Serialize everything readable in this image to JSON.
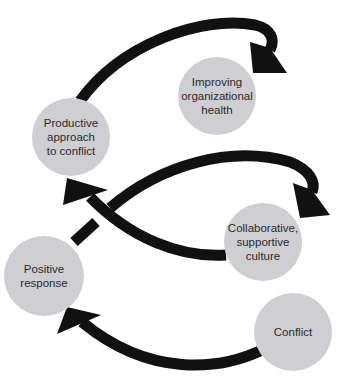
{
  "diagram": {
    "colors": {
      "node_fill": "#cfcfd3",
      "arrow": "#111111",
      "text": "#2a2a2a",
      "background": "#ffffff"
    },
    "nodes": [
      {
        "id": "improving",
        "label": "Improving\norganizational\nhealth",
        "cx": 217,
        "cy": 96,
        "r": 39
      },
      {
        "id": "productive",
        "label": "Productive\napproach\nto conflict",
        "cx": 71,
        "cy": 137,
        "r": 39
      },
      {
        "id": "collaborative",
        "label": "Collaborative,\nsupportive\nculture",
        "cx": 263,
        "cy": 242,
        "r": 39
      },
      {
        "id": "positive",
        "label": "Positive\nresponse",
        "cx": 44,
        "cy": 276,
        "r": 40
      },
      {
        "id": "conflict",
        "label": "Conflict",
        "cx": 293,
        "cy": 332,
        "r": 39
      }
    ],
    "edges": [
      {
        "from": "conflict",
        "to": "positive"
      },
      {
        "from": "positive",
        "to": "collaborative"
      },
      {
        "from": "collaborative",
        "to": "productive"
      },
      {
        "from": "productive",
        "to": "improving"
      }
    ]
  }
}
